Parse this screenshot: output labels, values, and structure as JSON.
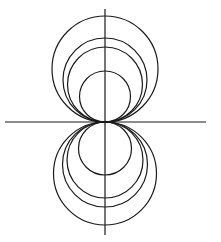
{
  "diagram": {
    "stroke_color": "#1a1a1a",
    "background": "#ffffff",
    "origin": {
      "x": 105,
      "y": 122
    },
    "horizontal_axis": {
      "x1": 5,
      "x2": 206,
      "y": 122
    },
    "vertical_axis": {
      "x": 105,
      "y1": 9,
      "y2": 235
    },
    "upper_circles": [
      {
        "r": 53
      },
      {
        "r": 42
      },
      {
        "r": 37.5
      },
      {
        "r": 25.5
      }
    ],
    "lower_circles": [
      {
        "r": 51.5
      },
      {
        "r": 42.5
      },
      {
        "r": 38
      },
      {
        "r": 26.5
      }
    ]
  }
}
